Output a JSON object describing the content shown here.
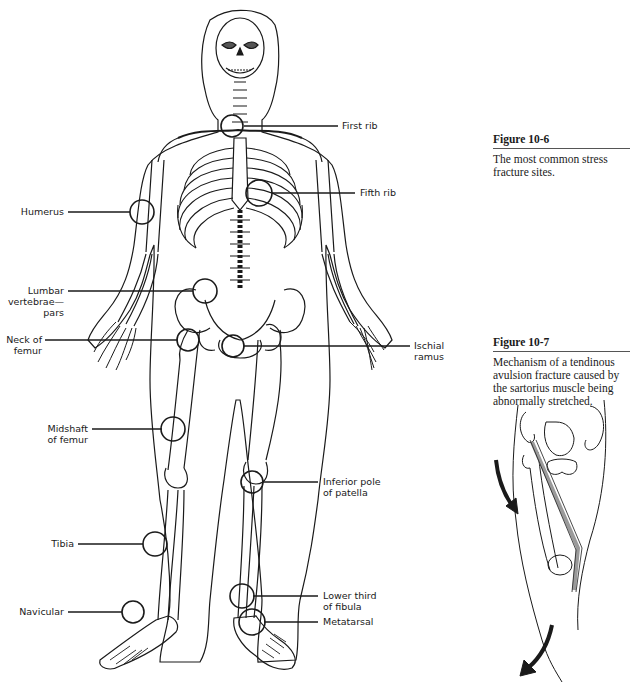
{
  "figures": [
    {
      "id": "fig-10-6",
      "title": "Figure 10-6",
      "caption": "The most common stress fracture sites."
    },
    {
      "id": "fig-10-7",
      "title": "Figure 10-7",
      "caption": "Mechanism of a tendinous avulsion fracture caused by the sartorius muscle being abnormally stretched."
    }
  ],
  "skeleton_labels": {
    "first_rib": "First rib",
    "fifth_rib": "Fifth rib",
    "humerus": "Humerus",
    "lumbar_1": "Lumbar",
    "lumbar_2": "vertebrae—",
    "lumbar_3": "pars",
    "neck_femur_1": "Neck of",
    "neck_femur_2": "femur",
    "ischial_1": "Ischial",
    "ischial_2": "ramus",
    "midshaft_1": "Midshaft",
    "midshaft_2": "of femur",
    "inferior_patella_1": "Inferior pole",
    "inferior_patella_2": "of patella",
    "tibia": "Tibia",
    "lower_fibula_1": "Lower third",
    "lower_fibula_2": "of fibula",
    "navicular": "Navicular",
    "metatarsal": "Metatarsal"
  },
  "colors": {
    "ink": "#1a1a1a",
    "rule": "#555555",
    "muscle": "#9a9a9a"
  }
}
